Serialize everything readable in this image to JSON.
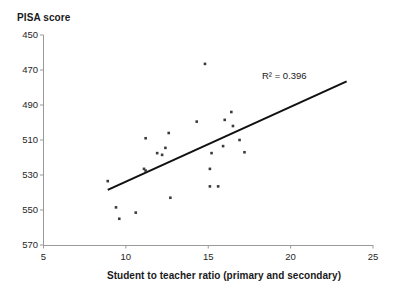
{
  "chart_data": {
    "type": "scatter",
    "title": "",
    "xlabel": "Student to teacher ratio (primary and secondary)",
    "ylabel": "PISA score",
    "xlim": [
      5,
      25
    ],
    "ylim": [
      450,
      570
    ],
    "xticks": [
      5,
      10,
      15,
      20,
      25
    ],
    "yticks": [
      450,
      470,
      490,
      510,
      530,
      550,
      570
    ],
    "grid": false,
    "legend": null,
    "annotations": [
      {
        "text": "R² = 0.396",
        "x": 18.3,
        "y": 541
      }
    ],
    "trendline": {
      "type": "linear",
      "x_start": 8.9,
      "y_start": 481.5,
      "x_end": 23.4,
      "y_end": 543.5,
      "r_squared": 0.396
    },
    "points": [
      {
        "x": 8.9,
        "y": 486.5
      },
      {
        "x": 9.4,
        "y": 471.5
      },
      {
        "x": 9.6,
        "y": 465.0
      },
      {
        "x": 10.6,
        "y": 468.5
      },
      {
        "x": 11.1,
        "y": 493.5
      },
      {
        "x": 11.2,
        "y": 492.5
      },
      {
        "x": 11.2,
        "y": 511.0
      },
      {
        "x": 11.9,
        "y": 502.5
      },
      {
        "x": 12.2,
        "y": 501.5
      },
      {
        "x": 12.4,
        "y": 505.5
      },
      {
        "x": 12.6,
        "y": 514.0
      },
      {
        "x": 12.7,
        "y": 477.0
      },
      {
        "x": 14.3,
        "y": 520.5
      },
      {
        "x": 14.8,
        "y": 553.5
      },
      {
        "x": 15.1,
        "y": 493.5
      },
      {
        "x": 15.1,
        "y": 483.5
      },
      {
        "x": 15.2,
        "y": 502.5
      },
      {
        "x": 15.6,
        "y": 483.5
      },
      {
        "x": 15.9,
        "y": 506.5
      },
      {
        "x": 16.0,
        "y": 521.5
      },
      {
        "x": 16.4,
        "y": 526.0
      },
      {
        "x": 16.5,
        "y": 518.0
      },
      {
        "x": 16.9,
        "y": 510.0
      },
      {
        "x": 17.2,
        "y": 503.0
      }
    ]
  },
  "axes": {
    "y_title": "PISA score",
    "x_title": "Student to teacher ratio (primary and secondary)",
    "y_tick_labels": [
      "570",
      "550",
      "530",
      "510",
      "490",
      "470",
      "450"
    ],
    "x_tick_labels": [
      "5",
      "10",
      "15",
      "20",
      "25"
    ]
  },
  "annotation": {
    "r_squared_label": "R² = 0.396"
  },
  "colors": {
    "axis": "#9a9a9a",
    "point": "#3b3b3b",
    "trendline": "#111111",
    "text": "#1a1a1a",
    "background": "#ffffff"
  }
}
